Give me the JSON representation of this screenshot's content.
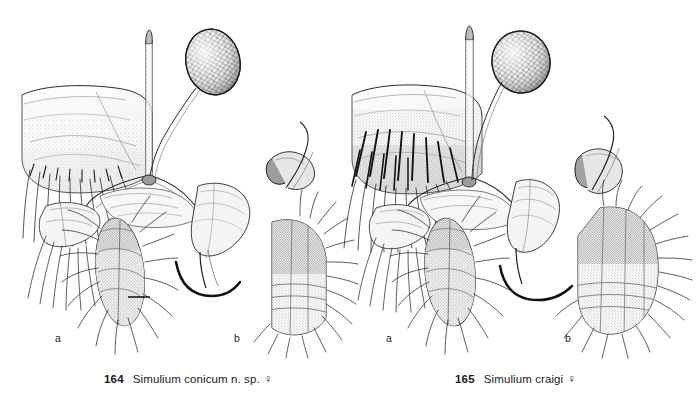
{
  "plate": {
    "type": "scientific-taxonomic-illustration",
    "subject": "Simuliidae female genitalia, pen-and-ink stipple drawings",
    "background_color": "#ffffff",
    "ink_color": "#1a1a1a",
    "figures": [
      {
        "id": "fig-164",
        "number": "164",
        "taxon": "Simulium conicum n. sp.",
        "sex_symbol": "♀",
        "caption_number": "164",
        "caption_text": "Simulium conicum n. sp.",
        "subfigures": [
          {
            "label": "a",
            "view": "ventral-genitalia"
          },
          {
            "label": "b",
            "view": "lateral-genitalia"
          }
        ]
      },
      {
        "id": "fig-165",
        "number": "165",
        "taxon": "Simulium craigi",
        "sex_symbol": "♀",
        "caption_number": "165",
        "caption_text": "Simulium craigi",
        "subfigures": [
          {
            "label": "a",
            "view": "ventral-genitalia"
          },
          {
            "label": "b",
            "view": "lateral-genitalia"
          }
        ]
      }
    ]
  },
  "labels": {
    "sub_a": "a",
    "sub_b": "b"
  }
}
